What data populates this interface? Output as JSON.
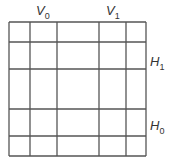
{
  "diagram": {
    "type": "grid-partition",
    "grid": {
      "x_lines": [
        9,
        30,
        57,
        99,
        126,
        146
      ],
      "y_lines": [
        22,
        42,
        69,
        109,
        136,
        156
      ],
      "line_color": "#555555"
    },
    "labels": [
      {
        "id": "V0",
        "base": "V",
        "sub": "0",
        "x": 36,
        "y": 3
      },
      {
        "id": "V1",
        "base": "V",
        "sub": "1",
        "x": 106,
        "y": 3
      },
      {
        "id": "H1",
        "base": "H",
        "sub": "1",
        "x": 150,
        "y": 54
      },
      {
        "id": "H0",
        "base": "H",
        "sub": "0",
        "x": 150,
        "y": 118
      }
    ]
  }
}
